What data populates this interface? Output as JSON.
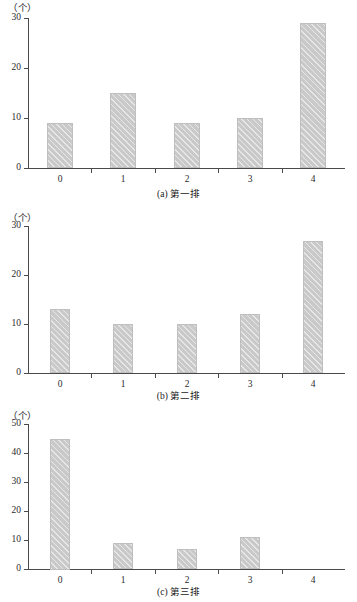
{
  "figure": {
    "unit_label": "（个）",
    "panels": [
      {
        "id": "a",
        "caption": "(a) 第一排",
        "unit_label": "（个）",
        "y_ticks": [
          "0",
          "10",
          "20",
          "30"
        ],
        "x_ticks": [
          "0",
          "1",
          "2",
          "3",
          "4"
        ]
      },
      {
        "id": "b",
        "caption": "(b) 第二排",
        "unit_label": "（个）",
        "y_ticks": [
          "0",
          "10",
          "20",
          "30"
        ],
        "x_ticks": [
          "0",
          "1",
          "2",
          "3",
          "4"
        ]
      },
      {
        "id": "c",
        "caption": "(c) 第三排",
        "unit_label": "（个）",
        "y_ticks": [
          "0",
          "10",
          "20",
          "30",
          "40",
          "50"
        ],
        "x_ticks": [
          "0",
          "1",
          "2",
          "3",
          "4"
        ]
      }
    ]
  },
  "colors": {
    "bar_fill": "#c9c9c9",
    "bar_edge": "#bfbfbf",
    "axis": "#4a4a4a",
    "text": "#1a1a1a",
    "background": "#ffffff"
  },
  "chart_data": [
    {
      "type": "bar",
      "title": "(a) 第一排",
      "xlabel": "",
      "ylabel": "（个）",
      "categories": [
        "0",
        "1",
        "2",
        "3",
        "4"
      ],
      "values": [
        9,
        15,
        9,
        10,
        29
      ],
      "ylim": [
        0,
        30
      ],
      "ytick_values": [
        0,
        10,
        20,
        30
      ],
      "grid": false,
      "legend": "none"
    },
    {
      "type": "bar",
      "title": "(b) 第二排",
      "xlabel": "",
      "ylabel": "（个）",
      "categories": [
        "0",
        "1",
        "2",
        "3",
        "4"
      ],
      "values": [
        13,
        10,
        10,
        12,
        27
      ],
      "ylim": [
        0,
        30
      ],
      "ytick_values": [
        0,
        10,
        20,
        30
      ],
      "grid": false,
      "legend": "none"
    },
    {
      "type": "bar",
      "title": "(c) 第三排",
      "xlabel": "",
      "ylabel": "（个）",
      "categories": [
        "0",
        "1",
        "2",
        "3",
        "4"
      ],
      "values": [
        45,
        9,
        7,
        11,
        0
      ],
      "ylim": [
        0,
        50
      ],
      "ytick_values": [
        0,
        10,
        20,
        30,
        40,
        50
      ],
      "grid": false,
      "legend": "none"
    }
  ]
}
